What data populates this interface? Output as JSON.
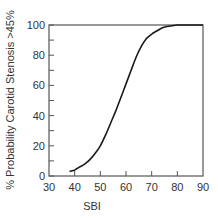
{
  "chart_data": {
    "type": "line",
    "title": "",
    "xlabel": "SBI",
    "ylabel": "% Probability Carotid Stenosis >45%",
    "xlim": [
      30,
      90
    ],
    "ylim": [
      0,
      100
    ],
    "x_ticks": [
      30,
      40,
      50,
      60,
      70,
      80,
      90
    ],
    "y_ticks": [
      0,
      20,
      40,
      60,
      80,
      100
    ],
    "y_minor_ticks": [
      10,
      30,
      50,
      70,
      90
    ],
    "grid": false,
    "legend": null,
    "series": [
      {
        "name": "probability",
        "x": [
          38,
          40,
          41,
          42,
          44,
          46,
          48,
          50,
          52,
          54,
          56,
          58,
          60,
          62,
          64,
          66,
          68,
          70,
          72,
          74,
          76,
          78,
          80,
          82,
          85,
          90
        ],
        "values": [
          3,
          4,
          5,
          6,
          8,
          11,
          15,
          20,
          27,
          35,
          43,
          52,
          61,
          70,
          79,
          86,
          91,
          94,
          96,
          98,
          99,
          99.5,
          100,
          100,
          100,
          100
        ]
      }
    ]
  },
  "colors": {
    "line": "#1a1a1a",
    "axis": "#555555",
    "text": "#333333",
    "background": "#ffffff"
  }
}
